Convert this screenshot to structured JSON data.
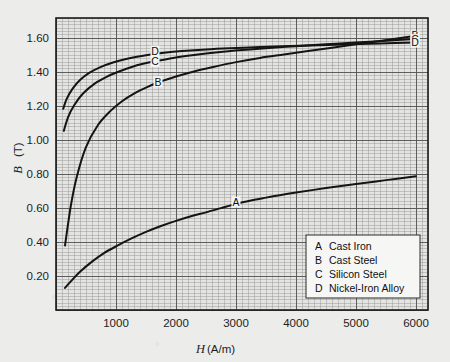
{
  "chart_data": {
    "type": "line",
    "title": "",
    "xlabel": "H (A/m)",
    "ylabel": "B (T)",
    "xlim": [
      0,
      6200
    ],
    "ylim": [
      0,
      1.72
    ],
    "xticks": [
      1000,
      2000,
      3000,
      4000,
      5000,
      6000
    ],
    "xticklabels": [
      "1000",
      "2000",
      "3000",
      "4000",
      "5000",
      "6000"
    ],
    "yticks": [
      0.2,
      0.4,
      0.6,
      0.8,
      1.0,
      1.2,
      1.4,
      1.6
    ],
    "yticklabels": [
      "0.20",
      "0.40",
      "0.60",
      "0.80",
      "1.00",
      "1.20",
      "1.40",
      "1.60"
    ],
    "grid": "major-and-minor",
    "legend_position": "lower-right",
    "series": [
      {
        "name": "A",
        "label": "Cast Iron",
        "inline_label": "A",
        "inline_label_x": 3000,
        "inline_label_y": 0.635,
        "x": [
          150,
          250,
          400,
          600,
          800,
          1000,
          1250,
          1500,
          1750,
          2000,
          2250,
          2500,
          2750,
          3000,
          3250,
          3500,
          3750,
          4000,
          4500,
          5000,
          5500,
          6000
        ],
        "y": [
          0.13,
          0.17,
          0.225,
          0.285,
          0.335,
          0.375,
          0.42,
          0.46,
          0.495,
          0.525,
          0.552,
          0.575,
          0.6,
          0.625,
          0.645,
          0.662,
          0.678,
          0.692,
          0.718,
          0.742,
          0.765,
          0.788
        ]
      },
      {
        "name": "B",
        "label": "Cast Steel",
        "inline_label": "B",
        "inline_label_x": 1700,
        "inline_label_y": 1.345,
        "x": [
          150,
          250,
          350,
          500,
          700,
          900,
          1100,
          1300,
          1500,
          1700,
          2000,
          2300,
          2600,
          3000,
          3400,
          3800,
          4200,
          4600,
          5000,
          5400,
          5800,
          6000
        ],
        "y": [
          0.38,
          0.62,
          0.79,
          0.96,
          1.09,
          1.17,
          1.23,
          1.275,
          1.31,
          1.34,
          1.375,
          1.405,
          1.43,
          1.46,
          1.485,
          1.505,
          1.525,
          1.545,
          1.565,
          1.585,
          1.605,
          1.615
        ]
      },
      {
        "name": "C",
        "label": "Silicon Steel",
        "inline_label": "C",
        "inline_label_x": 1650,
        "inline_label_y": 1.465,
        "x": [
          130,
          200,
          300,
          450,
          650,
          850,
          1050,
          1250,
          1450,
          1650,
          1950,
          2300,
          2700,
          3100,
          3500,
          4000,
          4500,
          5000,
          5500,
          6000
        ],
        "y": [
          1.055,
          1.135,
          1.205,
          1.275,
          1.335,
          1.375,
          1.405,
          1.43,
          1.45,
          1.465,
          1.485,
          1.502,
          1.518,
          1.531,
          1.542,
          1.554,
          1.565,
          1.576,
          1.586,
          1.596
        ]
      },
      {
        "name": "D",
        "label": "Nickel-Iron Alloy",
        "inline_label": "D",
        "inline_label_x": 1650,
        "inline_label_y": 1.525,
        "x": [
          120,
          180,
          280,
          400,
          560,
          750,
          950,
          1150,
          1350,
          1550,
          1800,
          2100,
          2500,
          2900,
          3400,
          3900,
          4400,
          4900,
          5400,
          6000
        ],
        "y": [
          1.185,
          1.245,
          1.305,
          1.355,
          1.398,
          1.432,
          1.458,
          1.477,
          1.492,
          1.504,
          1.515,
          1.525,
          1.535,
          1.542,
          1.549,
          1.555,
          1.56,
          1.565,
          1.57,
          1.575
        ]
      }
    ],
    "right_edge_labels": [
      {
        "letter": "B",
        "y": 1.615
      },
      {
        "letter": "C",
        "y": 1.596
      },
      {
        "letter": "D",
        "y": 1.575
      }
    ],
    "legend": [
      {
        "key": "A",
        "label": "Cast Iron"
      },
      {
        "key": "B",
        "label": "Cast Steel"
      },
      {
        "key": "C",
        "label": "Silicon Steel"
      },
      {
        "key": "D",
        "label": "Nickel-Iron Alloy"
      }
    ],
    "colors": {
      "curve": "#141414",
      "grid_minor": "#9a9a9a",
      "grid_major": "#4f4f4f",
      "frame": "#1a1a1a",
      "background": "#ececeb",
      "plot_background": "#e3e3e2"
    }
  }
}
